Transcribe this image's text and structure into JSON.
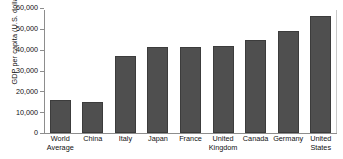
{
  "chart_data": {
    "type": "bar",
    "title": "",
    "xlabel": "",
    "ylabel": "GDP per capita (U.S. dollars)",
    "categories": [
      "World Average",
      "China",
      "Italy",
      "Japan",
      "France",
      "United Kingdom",
      "Canada",
      "Germany",
      "United States"
    ],
    "values": [
      16000,
      15000,
      37000,
      41500,
      41500,
      42000,
      44500,
      49000,
      56000
    ],
    "ylim": [
      0,
      60000
    ],
    "yticks": [
      0,
      10000,
      20000,
      30000,
      40000,
      50000,
      60000
    ],
    "ytick_labels": [
      "0",
      "10,000",
      "20,000",
      "30,000",
      "40,000",
      "50,000",
      "60,000"
    ],
    "grid": false,
    "legend": "none",
    "bar_color": "#4f4f4f",
    "axis_color": "#8d8d8d"
  },
  "axis": {
    "y_title": "GDP per capita (U.S. dollars)"
  },
  "categories_wrapped": [
    [
      "World",
      "Average"
    ],
    [
      "China"
    ],
    [
      "Italy"
    ],
    [
      "Japan"
    ],
    [
      "France"
    ],
    [
      "United",
      "Kingdom"
    ],
    [
      "Canada"
    ],
    [
      "Germany"
    ],
    [
      "United",
      "States"
    ]
  ]
}
